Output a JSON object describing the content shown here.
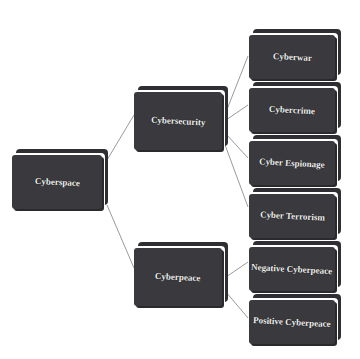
{
  "diagram": {
    "type": "tree",
    "colors": {
      "box_face": "#3a3a3e",
      "box_back": "#2f2f33",
      "text": "#f2f2f2",
      "line": "#9a9a9a",
      "background": "#ffffff"
    },
    "root": {
      "label": "Cyberspace"
    },
    "branches": [
      {
        "label": "Cybersecurity",
        "children": [
          {
            "label": "Cyberwar"
          },
          {
            "label": "Cybercrime"
          },
          {
            "label": "Cyber Espionage"
          },
          {
            "label": "Cyber Terrorism"
          }
        ]
      },
      {
        "label": "Cyberpeace",
        "children": [
          {
            "label": "Negative Cyberpeace"
          },
          {
            "label": "Positive Cyberpeace"
          }
        ]
      }
    ]
  }
}
